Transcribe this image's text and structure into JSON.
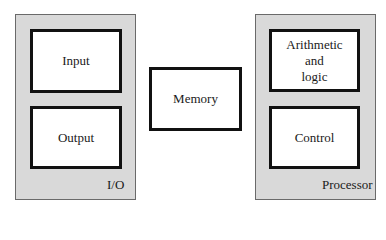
{
  "diagram": {
    "groups": [
      {
        "id": "io",
        "label": "I/O",
        "children": [
          {
            "id": "input",
            "label": "Input"
          },
          {
            "id": "output",
            "label": "Output"
          }
        ]
      },
      {
        "id": "memory",
        "label": "Memory"
      },
      {
        "id": "processor",
        "label": "Processor",
        "children": [
          {
            "id": "alu",
            "label": "Arithmetic\nand\nlogic"
          },
          {
            "id": "control",
            "label": "Control"
          }
        ]
      }
    ],
    "colors": {
      "group_fill": "#d9d9d9",
      "box_fill": "#ffffff",
      "box_border": "#111111"
    }
  }
}
